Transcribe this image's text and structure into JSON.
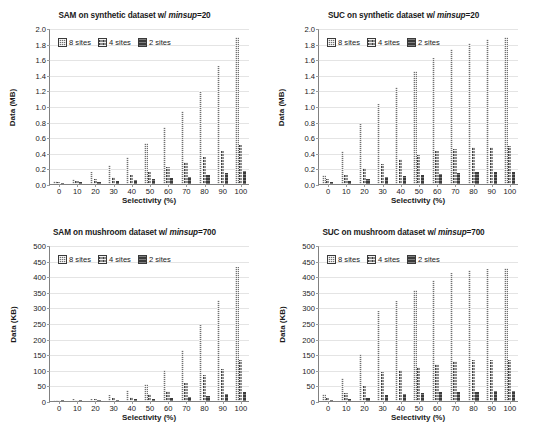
{
  "figure": {
    "panel_count": 4,
    "series_names": [
      "8 sites",
      "4 sites",
      "2 sites"
    ],
    "colors": {
      "series_8_sites": "#707070",
      "series_4_sites": "#8e8e8e",
      "series_2_sites": "#3b3b3b",
      "gridline": "#e4e4e4",
      "axis": "#808080"
    }
  },
  "chart_data": [
    {
      "type": "bar",
      "panel": "top-left",
      "title": "SAM on synthetic dataset w/ minsup=20",
      "title_prefix": "SAM on synthetic dataset w/ ",
      "title_italic": "minsup",
      "title_suffix": "=20",
      "xlabel": "Selectivity (%)",
      "ylabel": "Data (MB)",
      "categories": [
        "0",
        "10",
        "20",
        "30",
        "40",
        "50",
        "60",
        "70",
        "80",
        "90",
        "100"
      ],
      "ylim": [
        0,
        2.0
      ],
      "yticks": [
        "0.0",
        "0.2",
        "0.4",
        "0.6",
        "0.8",
        "1.0",
        "1.2",
        "1.4",
        "1.6",
        "1.8",
        "2.0"
      ],
      "ytick_values": [
        0,
        0.2,
        0.4,
        0.6,
        0.8,
        1.0,
        1.2,
        1.4,
        1.6,
        1.8,
        2.0
      ],
      "grid": true,
      "legend": [
        "8 sites",
        "4 sites",
        "2 sites"
      ],
      "legend_position": "top-left",
      "series": [
        {
          "name": "8 sites",
          "values": [
            0.04,
            0.07,
            0.16,
            0.24,
            0.35,
            0.52,
            0.73,
            0.94,
            1.19,
            1.51,
            1.89
          ]
        },
        {
          "name": "4 sites",
          "values": [
            0.03,
            0.04,
            0.06,
            0.09,
            0.12,
            0.16,
            0.22,
            0.28,
            0.34,
            0.42,
            0.5
          ]
        },
        {
          "name": "2 sites",
          "values": [
            0.01,
            0.02,
            0.03,
            0.04,
            0.05,
            0.06,
            0.08,
            0.09,
            0.11,
            0.14,
            0.17
          ]
        }
      ]
    },
    {
      "type": "bar",
      "panel": "top-right",
      "title": "SUC on synthetic dataset w/ minsup=20",
      "title_prefix": "SUC on synthetic dataset w/ ",
      "title_italic": "minsup",
      "title_suffix": "=20",
      "xlabel": "Selectivity (%)",
      "ylabel": "Data (MB)",
      "categories": [
        "0",
        "10",
        "20",
        "30",
        "40",
        "50",
        "60",
        "70",
        "80",
        "90",
        "100"
      ],
      "ylim": [
        0,
        2.0
      ],
      "yticks": [
        "0.0",
        "0.2",
        "0.4",
        "0.6",
        "0.8",
        "1.0",
        "1.2",
        "1.4",
        "1.6",
        "1.8",
        "2.0"
      ],
      "ytick_values": [
        0,
        0.2,
        0.4,
        0.6,
        0.8,
        1.0,
        1.2,
        1.4,
        1.6,
        1.8,
        2.0
      ],
      "grid": true,
      "legend": [
        "8 sites",
        "4 sites",
        "2 sites"
      ],
      "legend_position": "top-left",
      "series": [
        {
          "name": "8 sites",
          "values": [
            0.11,
            0.42,
            0.77,
            1.02,
            1.25,
            1.45,
            1.61,
            1.73,
            1.81,
            1.86,
            1.89
          ]
        },
        {
          "name": "4 sites",
          "values": [
            0.06,
            0.11,
            0.2,
            0.26,
            0.32,
            0.37,
            0.42,
            0.45,
            0.47,
            0.48,
            0.49
          ]
        },
        {
          "name": "2 sites",
          "values": [
            0.02,
            0.04,
            0.07,
            0.09,
            0.1,
            0.12,
            0.13,
            0.14,
            0.15,
            0.15,
            0.15
          ]
        }
      ]
    },
    {
      "type": "bar",
      "panel": "bottom-left",
      "title": "SAM on mushroom dataset w/ minsup=700",
      "title_prefix": "SAM on mushroom dataset w/ ",
      "title_italic": "minsup",
      "title_suffix": "=700",
      "xlabel": "Selectivity (%)",
      "ylabel": "Data (KB)",
      "categories": [
        "0",
        "10",
        "20",
        "30",
        "40",
        "50",
        "60",
        "70",
        "80",
        "90",
        "100"
      ],
      "ylim": [
        0,
        500
      ],
      "yticks": [
        "0",
        "50",
        "100",
        "150",
        "200",
        "250",
        "300",
        "350",
        "400",
        "450",
        "500"
      ],
      "ytick_values": [
        0,
        50,
        100,
        150,
        200,
        250,
        300,
        350,
        400,
        450,
        500
      ],
      "grid": true,
      "legend": [
        "8 sites",
        "4 sites",
        "2 sites"
      ],
      "legend_position": "top-left",
      "series": [
        {
          "name": "8 sites",
          "values": [
            4,
            5,
            8,
            18,
            34,
            56,
            98,
            165,
            245,
            323,
            428
          ]
        },
        {
          "name": "4 sites",
          "values": [
            2,
            3,
            5,
            9,
            14,
            21,
            33,
            57,
            82,
            104,
            132
          ]
        },
        {
          "name": "2 sites",
          "values": [
            1,
            2,
            3,
            4,
            6,
            8,
            10,
            13,
            17,
            21,
            29
          ]
        }
      ]
    },
    {
      "type": "bar",
      "panel": "bottom-right",
      "title": "SUC on mushroom dataset w/ minsup=700",
      "title_prefix": "SUC on mushroom dataset w/ ",
      "title_italic": "minsup",
      "title_suffix": "=700",
      "xlabel": "Selectivity (%)",
      "ylabel": "Data (KB)",
      "categories": [
        "0",
        "10",
        "20",
        "30",
        "40",
        "50",
        "60",
        "70",
        "80",
        "90",
        "100"
      ],
      "ylim": [
        0,
        500
      ],
      "yticks": [
        "0",
        "50",
        "100",
        "150",
        "200",
        "250",
        "300",
        "350",
        "400",
        "450",
        "500"
      ],
      "ytick_values": [
        0,
        50,
        100,
        150,
        200,
        250,
        300,
        350,
        400,
        450,
        500
      ],
      "grid": true,
      "legend": [
        "8 sites",
        "4 sites",
        "2 sites"
      ],
      "legend_position": "top-left",
      "series": [
        {
          "name": "8 sites",
          "values": [
            22,
            74,
            150,
            288,
            321,
            355,
            387,
            410,
            419,
            424,
            425
          ]
        },
        {
          "name": "4 sites",
          "values": [
            10,
            26,
            47,
            92,
            100,
            109,
            119,
            127,
            130,
            131,
            132
          ]
        },
        {
          "name": "2 sites",
          "values": [
            3,
            6,
            11,
            20,
            23,
            26,
            28,
            29,
            30,
            31,
            31
          ]
        }
      ]
    }
  ]
}
